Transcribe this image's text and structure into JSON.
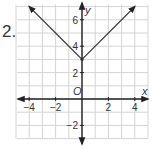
{
  "problem_number": "2.",
  "chart_data": {
    "type": "line",
    "title": "",
    "xlabel": "x",
    "ylabel": "y",
    "origin_label": "O",
    "xlim": [
      -5,
      5
    ],
    "ylim": [
      -3,
      7
    ],
    "grid": true,
    "x_ticks": [
      -4,
      -2,
      2,
      4
    ],
    "y_ticks": [
      -2,
      2,
      4,
      6
    ],
    "x_tick_labels": [
      "−4",
      "−2",
      "2",
      "4"
    ],
    "y_tick_labels": [
      "−2",
      "2",
      "4",
      "6"
    ],
    "series": [
      {
        "name": "y = |x| + 3",
        "points": [
          [
            -4,
            7
          ],
          [
            0,
            3
          ],
          [
            4,
            7
          ]
        ],
        "arrows_at_ends": true
      }
    ],
    "colors": {
      "grid": "#d4d4d4",
      "axis": "#222222",
      "line": "#333333"
    }
  }
}
